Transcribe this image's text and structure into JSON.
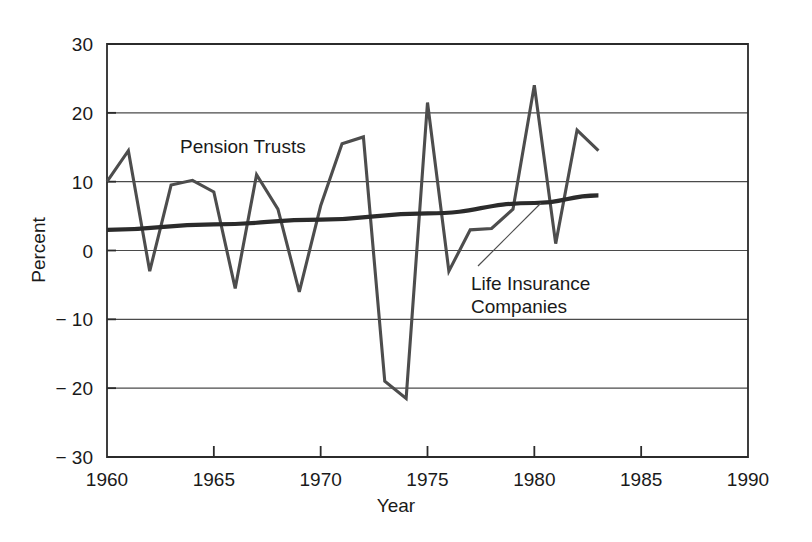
{
  "chart_data": {
    "type": "line",
    "title": "",
    "xlabel": "Year",
    "ylabel": "Percent",
    "xlim": [
      1960,
      1990
    ],
    "ylim": [
      -30,
      30
    ],
    "xticks": [
      1960,
      1965,
      1970,
      1975,
      1980,
      1985,
      1990
    ],
    "xtick_labels": [
      "1960",
      "1965",
      "1970",
      "1975",
      "1980",
      "1985",
      "1990"
    ],
    "yticks": [
      30,
      20,
      10,
      0,
      -10,
      -20,
      -30
    ],
    "ytick_labels": [
      "30",
      "20",
      "10",
      "0",
      "− 10",
      "− 20",
      "− 30"
    ],
    "grid": "horizontal",
    "legend": "inline-annotations",
    "series": [
      {
        "name": "Pension Trusts",
        "label_position": "inside-upper-left",
        "x": [
          1960,
          1961,
          1962,
          1963,
          1964,
          1965,
          1966,
          1967,
          1968,
          1969,
          1970,
          1971,
          1972,
          1973,
          1974,
          1975,
          1976,
          1977,
          1978,
          1979,
          1980,
          1981,
          1982,
          1983
        ],
        "values": [
          10.0,
          14.5,
          -3.0,
          9.5,
          10.2,
          8.5,
          -5.5,
          11.0,
          6.0,
          -6.0,
          6.5,
          15.5,
          16.5,
          -19.0,
          -21.5,
          21.5,
          -3.0,
          3.0,
          3.2,
          6.0,
          24.0,
          1.0,
          17.5,
          14.5
        ]
      },
      {
        "name": "Life Insurance Companies",
        "label_position": "annotation-with-leader",
        "x": [
          1960,
          1965,
          1970,
          1975,
          1980,
          1983
        ],
        "values": [
          3.0,
          3.8,
          4.5,
          5.4,
          6.9,
          8.0
        ]
      }
    ],
    "annotations": [
      {
        "text": "Pension Trusts",
        "x": 1963.4,
        "y": 13.2
      },
      {
        "text": "Life Insurance",
        "x": 1976.0,
        "y": -3.6
      },
      {
        "text": "Companies",
        "x": 1976.0,
        "y": -6.6
      }
    ]
  },
  "axis": {
    "y_title": "Percent",
    "x_title": "Year"
  },
  "labels": {
    "pension_trusts": "Pension Trusts",
    "life_insurance_line1": "Life Insurance",
    "life_insurance_line2": "Companies"
  },
  "colors": {
    "background": "#ffffff",
    "frame": "#2b2b2b",
    "gridline": "#4a4a4a",
    "pension_trusts_line": "#4d4d4d",
    "life_insurance_line": "#2b2b2b",
    "text": "#1a1a1a"
  }
}
